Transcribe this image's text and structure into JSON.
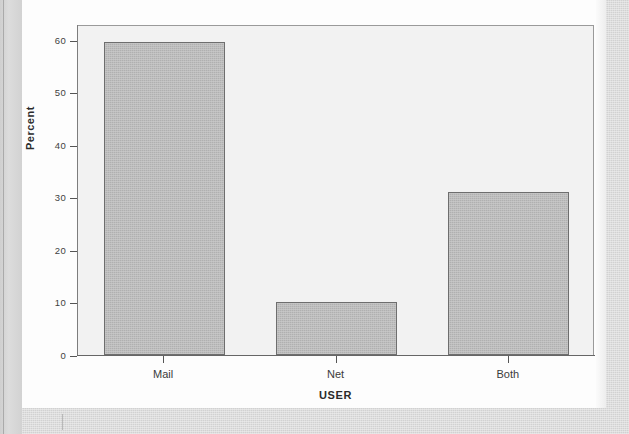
{
  "page": {
    "media": "scanned-page",
    "background_color": "#d9d9d9",
    "page_color": "#fdfdfd"
  },
  "chart_data": {
    "type": "bar",
    "title": "",
    "subtitle": "",
    "xlabel": "USER",
    "ylabel": "Percent",
    "categories": [
      "Mail",
      "Net",
      "Both"
    ],
    "values": [
      59.5,
      10,
      31
    ],
    "ylim": [
      0,
      63
    ],
    "yticks": [
      0,
      10,
      20,
      30,
      40,
      50,
      60
    ],
    "ytick_labels": [
      "0",
      "10",
      "20",
      "30",
      "40",
      "50",
      "60"
    ],
    "grid": false,
    "legend": null,
    "legend_position": "none",
    "bar_fill_color": "#b6b6b6",
    "bar_edge_color": "#6e6e6e",
    "plot_background_color": "#f2f2f2",
    "axis_color": "#666666",
    "series": [
      {
        "name": "Percent",
        "values": [
          59.5,
          10,
          31
        ]
      }
    ],
    "annotations": []
  }
}
